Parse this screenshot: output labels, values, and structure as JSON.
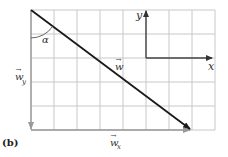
{
  "figure": {
    "panel_label": "(b)",
    "grid": {
      "left": 31,
      "top": 10,
      "right": 215,
      "bottom": 130,
      "cols": 8,
      "rows": 5,
      "line_color": "#c8c8c8"
    },
    "axes": {
      "x_label": "x",
      "y_label": "y",
      "color": "#555555"
    },
    "vectors": {
      "w": {
        "label": "w",
        "subscript": "",
        "color": "#1a1a1a"
      },
      "w_x": {
        "label": "w",
        "subscript": "x",
        "color": "#888888"
      },
      "w_y": {
        "label": "w",
        "subscript": "y",
        "color": "#888888"
      }
    },
    "angle": {
      "label": "α"
    }
  }
}
